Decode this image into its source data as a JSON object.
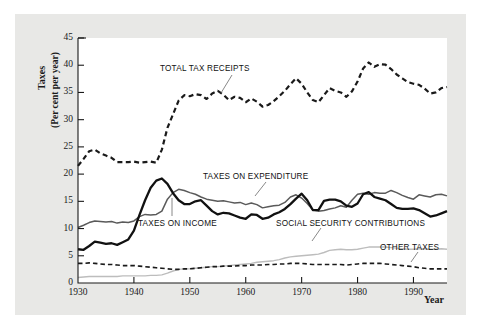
{
  "figure": {
    "background_color": "#e8e8e6",
    "plot_background_color": "#ffffff",
    "axis_color": "#1a1a1a"
  },
  "axes": {
    "y_title_line1": "Taxes",
    "y_title_line2": "(Per cent per year)",
    "x_title": "Year",
    "y_ticks": [
      "0",
      "5",
      "10",
      "15",
      "20",
      "25",
      "30",
      "35",
      "40",
      "45"
    ],
    "x_ticks": [
      "1930",
      "1940",
      "1950",
      "1960",
      "1970",
      "1980",
      "1990"
    ]
  },
  "annotations": [
    {
      "name": "total-tax-receipts-label",
      "text": "TOTAL TAX RECEIPTS"
    },
    {
      "name": "taxes-on-expenditure-label",
      "text": "TAXES ON EXPENDITURE"
    },
    {
      "name": "taxes-on-income-label",
      "text": "TAXES ON INCOME"
    },
    {
      "name": "social-security-contributions-label",
      "text": "SOCIAL SECURITY CONTRIBUTIONS"
    },
    {
      "name": "other-taxes-label",
      "text": "OTHER TAXES"
    }
  ],
  "chart_data": {
    "type": "line",
    "title": "",
    "xlabel": "Year",
    "ylabel": "Taxes (Per cent per year)",
    "xlim": [
      1930,
      1996
    ],
    "ylim": [
      0,
      45
    ],
    "grid": false,
    "legend": "inline-annotations",
    "x": [
      1930,
      1931,
      1932,
      1933,
      1934,
      1935,
      1936,
      1937,
      1938,
      1939,
      1940,
      1941,
      1942,
      1943,
      1944,
      1945,
      1946,
      1947,
      1948,
      1949,
      1950,
      1951,
      1952,
      1953,
      1954,
      1955,
      1956,
      1957,
      1958,
      1959,
      1960,
      1961,
      1962,
      1963,
      1964,
      1965,
      1966,
      1967,
      1968,
      1969,
      1970,
      1971,
      1972,
      1973,
      1974,
      1975,
      1976,
      1977,
      1978,
      1979,
      1980,
      1981,
      1982,
      1983,
      1984,
      1985,
      1986,
      1987,
      1988,
      1989,
      1990,
      1991,
      1992,
      1993,
      1994,
      1995,
      1996
    ],
    "series": [
      {
        "name": "TOTAL TAX RECEIPTS",
        "style": "dashed",
        "color": "#1a1a1a",
        "width": 2.2,
        "values": [
          21.5,
          22.8,
          24.2,
          24.5,
          23.8,
          23.4,
          23.0,
          22.2,
          22.2,
          22.2,
          22.3,
          22.1,
          22.2,
          22.3,
          22.1,
          24.5,
          28.5,
          31.0,
          33.5,
          34.5,
          34.3,
          34.7,
          34.5,
          33.8,
          34.8,
          35.3,
          34.6,
          33.6,
          34.2,
          34.0,
          33.2,
          33.9,
          33.3,
          32.4,
          32.7,
          33.4,
          34.3,
          35.3,
          36.5,
          37.6,
          36.6,
          35.0,
          33.6,
          33.2,
          34.5,
          35.8,
          35.3,
          35.0,
          34.2,
          35.2,
          37.0,
          39.4,
          40.5,
          39.7,
          40.2,
          40.1,
          39.3,
          38.3,
          37.6,
          36.9,
          36.6,
          36.4,
          35.7,
          34.8,
          35.0,
          35.8,
          36.0
        ]
      },
      {
        "name": "TAXES ON EXPENDITURE",
        "style": "solid",
        "color": "#5a5a5a",
        "width": 1.5,
        "values": [
          10.2,
          10.6,
          11.1,
          11.4,
          11.3,
          11.2,
          11.3,
          11.0,
          11.2,
          11.1,
          11.4,
          12.2,
          12.6,
          12.5,
          12.6,
          13.2,
          15.4,
          16.6,
          17.2,
          17.0,
          16.6,
          16.3,
          15.8,
          15.4,
          15.2,
          15.0,
          15.1,
          14.9,
          14.7,
          14.8,
          14.4,
          14.7,
          14.4,
          13.8,
          14.0,
          14.2,
          14.3,
          14.8,
          15.8,
          16.2,
          15.6,
          14.6,
          13.4,
          13.2,
          13.3,
          13.6,
          13.8,
          14.2,
          13.9,
          15.2,
          16.3,
          16.5,
          16.3,
          16.6,
          16.5,
          16.5,
          17.0,
          16.6,
          16.1,
          15.7,
          15.4,
          16.2,
          16.0,
          15.8,
          16.2,
          16.3,
          16.0
        ]
      },
      {
        "name": "TAXES ON INCOME",
        "style": "solid",
        "color": "#111111",
        "width": 2.3,
        "values": [
          6.2,
          6.1,
          6.8,
          7.6,
          7.4,
          7.2,
          7.3,
          7.0,
          7.5,
          8.0,
          9.6,
          12.5,
          15.2,
          17.5,
          18.8,
          19.2,
          18.2,
          16.5,
          15.2,
          14.5,
          14.5,
          15.0,
          15.2,
          14.2,
          13.2,
          12.6,
          12.9,
          12.8,
          12.4,
          12.0,
          11.8,
          12.6,
          12.5,
          11.8,
          12.0,
          12.6,
          13.0,
          13.6,
          14.5,
          15.5,
          16.4,
          15.2,
          13.4,
          13.4,
          15.1,
          15.3,
          15.3,
          15.0,
          14.2,
          14.0,
          14.6,
          16.3,
          16.7,
          15.8,
          15.5,
          15.2,
          14.5,
          13.8,
          13.6,
          13.6,
          13.7,
          13.4,
          12.8,
          12.2,
          12.4,
          12.8,
          13.2
        ]
      },
      {
        "name": "SOCIAL SECURITY CONTRIBUTIONS",
        "style": "solid",
        "color": "#bdbdbd",
        "width": 1.4,
        "values": [
          1.0,
          1.1,
          1.2,
          1.2,
          1.2,
          1.2,
          1.2,
          1.2,
          1.3,
          1.3,
          1.3,
          1.3,
          1.3,
          1.4,
          1.4,
          1.5,
          1.8,
          2.2,
          2.5,
          2.6,
          2.6,
          2.7,
          2.8,
          2.9,
          3.0,
          3.0,
          3.1,
          3.2,
          3.3,
          3.4,
          3.5,
          3.6,
          3.8,
          3.9,
          4.0,
          4.1,
          4.3,
          4.6,
          4.8,
          4.9,
          5.0,
          5.1,
          5.2,
          5.3,
          5.6,
          6.0,
          6.1,
          6.2,
          6.1,
          6.1,
          6.2,
          6.4,
          6.6,
          6.6,
          6.6,
          6.6,
          6.5,
          6.4,
          6.3,
          6.2,
          6.2,
          6.3,
          6.3,
          6.2,
          6.2,
          6.3,
          6.2
        ]
      },
      {
        "name": "OTHER TAXES",
        "style": "dashed",
        "color": "#1a1a1a",
        "width": 1.6,
        "values": [
          3.6,
          3.6,
          3.7,
          3.6,
          3.5,
          3.4,
          3.4,
          3.3,
          3.2,
          3.2,
          3.2,
          3.1,
          3.0,
          2.9,
          2.8,
          2.7,
          2.6,
          2.5,
          2.5,
          2.6,
          2.6,
          2.7,
          2.8,
          2.9,
          3.0,
          3.0,
          3.1,
          3.1,
          3.1,
          3.2,
          3.2,
          3.3,
          3.3,
          3.3,
          3.4,
          3.4,
          3.5,
          3.5,
          3.6,
          3.6,
          3.6,
          3.5,
          3.4,
          3.4,
          3.4,
          3.4,
          3.4,
          3.4,
          3.3,
          3.4,
          3.5,
          3.6,
          3.6,
          3.6,
          3.6,
          3.5,
          3.4,
          3.3,
          3.2,
          3.1,
          3.0,
          2.8,
          2.7,
          2.6,
          2.6,
          2.6,
          2.6
        ]
      }
    ]
  }
}
